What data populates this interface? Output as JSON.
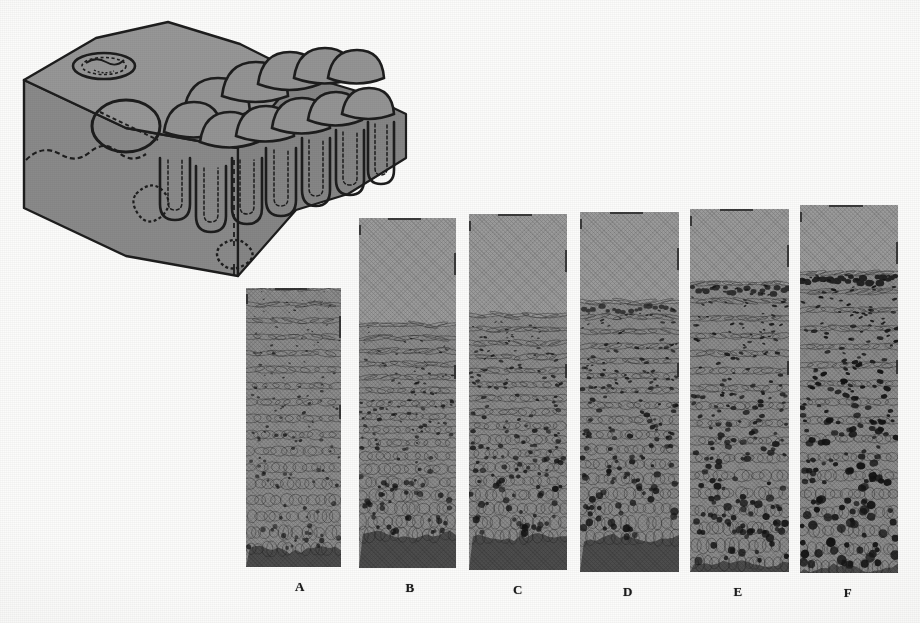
{
  "figure": {
    "caption_labels": [
      "A",
      "B",
      "C",
      "D",
      "E",
      "F"
    ],
    "background_color": "#fcfcfb",
    "ink_color": "#1b1b1b"
  },
  "block_diagram": {
    "name": "three-dimensional-epithelium-block",
    "fill_color": "#8e8e8e",
    "top_face_color": "#979797",
    "front_face_color": "#8a8a8a",
    "outline_color": "#1d1d1d",
    "features": {
      "surface_dome_cells": 11,
      "crypt_invaginations": 9,
      "pore_ring_top_left": 1,
      "duct_circle_mid_left": 1,
      "small_ring_front_face": 2
    }
  },
  "panels": {
    "tone_upper_background": "#9c9c9c",
    "tone_lower_band": "#4d4d4d",
    "tone_cytoplasm": "#8d8d8d",
    "tone_nucleus": "#141414",
    "items": [
      {
        "label": "A",
        "name": "panel-a",
        "x": 246,
        "y": 288,
        "w": 95,
        "h": 279,
        "tissue_top": 0.0,
        "lower_band_top": 0.935,
        "nuclei_count": 120,
        "nucleus_scale": 0.72,
        "density": 0.62,
        "darkness": 0.48,
        "seed": 11,
        "label_x": 300
      },
      {
        "label": "B",
        "name": "panel-b",
        "x": 359,
        "y": 218,
        "w": 97,
        "h": 350,
        "tissue_top": 0.305,
        "lower_band_top": 0.905,
        "nuclei_count": 132,
        "nucleus_scale": 0.85,
        "density": 0.68,
        "darkness": 0.58,
        "seed": 23,
        "label_x": 410
      },
      {
        "label": "C",
        "name": "panel-c",
        "x": 469,
        "y": 214,
        "w": 98,
        "h": 356,
        "tissue_top": 0.285,
        "lower_band_top": 0.905,
        "nuclei_count": 150,
        "nucleus_scale": 0.95,
        "density": 0.74,
        "darkness": 0.66,
        "seed": 37,
        "label_x": 518
      },
      {
        "label": "D",
        "name": "panel-d",
        "x": 580,
        "y": 212,
        "w": 99,
        "h": 360,
        "tissue_top": 0.25,
        "lower_band_top": 0.905,
        "nuclei_count": 168,
        "nucleus_scale": 1.04,
        "density": 0.8,
        "darkness": 0.74,
        "seed": 53,
        "label_x": 628
      },
      {
        "label": "E",
        "name": "panel-e",
        "x": 690,
        "y": 209,
        "w": 99,
        "h": 363,
        "tissue_top": 0.205,
        "lower_band_top": 0.975,
        "nuclei_count": 190,
        "nucleus_scale": 1.14,
        "density": 0.86,
        "darkness": 0.83,
        "seed": 71,
        "label_x": 738
      },
      {
        "label": "F",
        "name": "panel-f",
        "x": 800,
        "y": 205,
        "w": 98,
        "h": 368,
        "tissue_top": 0.185,
        "lower_band_top": 0.985,
        "nuclei_count": 215,
        "nucleus_scale": 1.3,
        "density": 0.95,
        "darkness": 0.96,
        "seed": 97,
        "label_x": 848
      }
    ]
  }
}
